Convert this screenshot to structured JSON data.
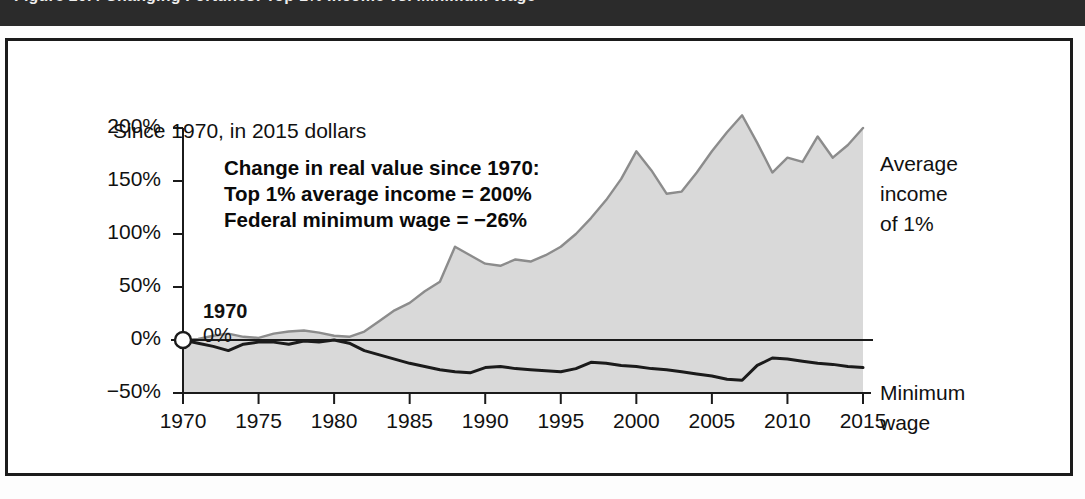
{
  "header": {
    "figure_caption": "Figure 20.4  Changing Fortunes: Top 1% Income vs. Minimum Wage"
  },
  "chart_data": {
    "type": "area",
    "title": "",
    "subtitle": "Since 1970, in 2015 dollars",
    "xlabel": "",
    "ylabel": "",
    "xlim": [
      1970,
      2015
    ],
    "ylim": [
      -50,
      200
    ],
    "grid": false,
    "legend_position": "right-inline",
    "ytick_labels": [
      "200%",
      "150%",
      "100%",
      "50%",
      "0%",
      "−50%"
    ],
    "ytick_values": [
      200,
      150,
      100,
      50,
      0,
      -50
    ],
    "xtick_labels": [
      "1970",
      "1975",
      "1980",
      "1985",
      "1990",
      "1995",
      "2000",
      "2005",
      "2010",
      "2015"
    ],
    "xtick_values": [
      1970,
      1975,
      1980,
      1985,
      1990,
      1995,
      2000,
      2005,
      2010,
      2015
    ],
    "x": [
      1970,
      1971,
      1972,
      1973,
      1974,
      1975,
      1976,
      1977,
      1978,
      1979,
      1980,
      1981,
      1982,
      1983,
      1984,
      1985,
      1986,
      1987,
      1988,
      1989,
      1990,
      1991,
      1992,
      1993,
      1994,
      1995,
      1996,
      1997,
      1998,
      1999,
      2000,
      2001,
      2002,
      2003,
      2004,
      2005,
      2006,
      2007,
      2008,
      2009,
      2010,
      2011,
      2012,
      2013,
      2014,
      2015
    ],
    "series": [
      {
        "name": "Average income of 1%",
        "label": "Average income of 1%",
        "color": "#d9d9d9",
        "line_color": "#8c8c8c",
        "fill": true,
        "values": [
          0,
          1,
          4,
          6,
          3,
          2,
          6,
          8,
          9,
          7,
          4,
          3,
          8,
          18,
          28,
          35,
          46,
          55,
          88,
          80,
          72,
          70,
          76,
          74,
          80,
          88,
          100,
          115,
          132,
          152,
          178,
          160,
          138,
          140,
          158,
          178,
          196,
          212,
          186,
          158,
          172,
          168,
          192,
          172,
          184,
          200
        ]
      },
      {
        "name": "Minimum wage",
        "label": "Minimum wage",
        "color": "#1b1b1b",
        "line_color": "#1b1b1b",
        "fill": false,
        "values": [
          0,
          -3,
          -6,
          -10,
          -4,
          -2,
          -2,
          -4,
          -1,
          -2,
          0,
          -3,
          -10,
          -14,
          -18,
          -22,
          -25,
          -28,
          -30,
          -31,
          -26,
          -25,
          -27,
          -28,
          -29,
          -30,
          -27,
          -21,
          -22,
          -24,
          -25,
          -27,
          -28,
          -30,
          -32,
          -34,
          -37,
          -38,
          -24,
          -17,
          -18,
          -20,
          -22,
          -23,
          -25,
          -26
        ]
      }
    ],
    "annotations": {
      "box": {
        "line1": "Change in real value since 1970:",
        "line2": "Top 1% average income = 200%",
        "line3": "Federal minimum wage = −26%"
      },
      "origin_marker": {
        "year": "1970",
        "value": "0%",
        "x": 1970,
        "y": 0
      }
    },
    "legend_labels": {
      "top_line1": "Average",
      "top_line2": "income",
      "top_line3": "of 1%",
      "bottom_line1": "Minimum",
      "bottom_line2": "wage"
    }
  },
  "colors": {
    "area_fill": "#d9d9d9",
    "area_stroke": "#8c8c8c",
    "line_dark": "#1b1b1b",
    "frame": "#1b1b1b",
    "header_bg": "#2b2b2b",
    "text": "#111111",
    "page_bg": "#ffffff"
  }
}
